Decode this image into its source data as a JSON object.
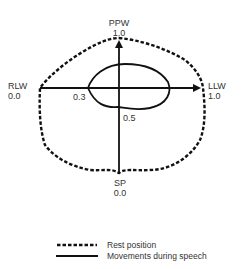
{
  "diagram": {
    "axes": {
      "top": {
        "name": "PPW",
        "value": "1.0"
      },
      "left": {
        "name": "RLW",
        "value": "0.0"
      },
      "right": {
        "name": "LLW",
        "value": "1.0"
      },
      "bottom": {
        "name": "SP",
        "value": "0.0"
      }
    },
    "inner_labels": {
      "left_point": "0.3",
      "bottom_point": "0.5"
    },
    "legend": [
      {
        "style": "dashed",
        "label": "Rest position"
      },
      {
        "style": "solid",
        "label": "Movements during speech"
      }
    ],
    "colors": {
      "line": "#111111",
      "text": "#333333",
      "background": "#ffffff"
    }
  }
}
